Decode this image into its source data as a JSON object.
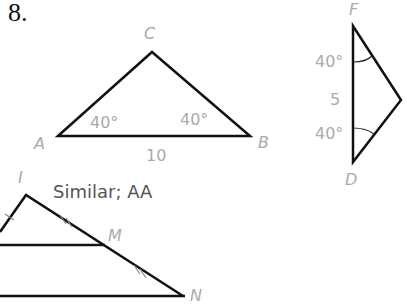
{
  "problem": {
    "number": "8."
  },
  "triangle_abc": {
    "vertices": {
      "A": "A",
      "B": "B",
      "C": "C"
    },
    "angle_a": "40°",
    "angle_b": "40°",
    "side_ab": "10"
  },
  "triangle_def": {
    "vertices": {
      "F": "F",
      "D": "D"
    },
    "angle_f": "40°",
    "angle_d": "40°",
    "side_fd": "5"
  },
  "triangle_imn": {
    "vertices": {
      "I": "I",
      "M": "M",
      "N": "N"
    }
  },
  "answer": "Similar; AA"
}
